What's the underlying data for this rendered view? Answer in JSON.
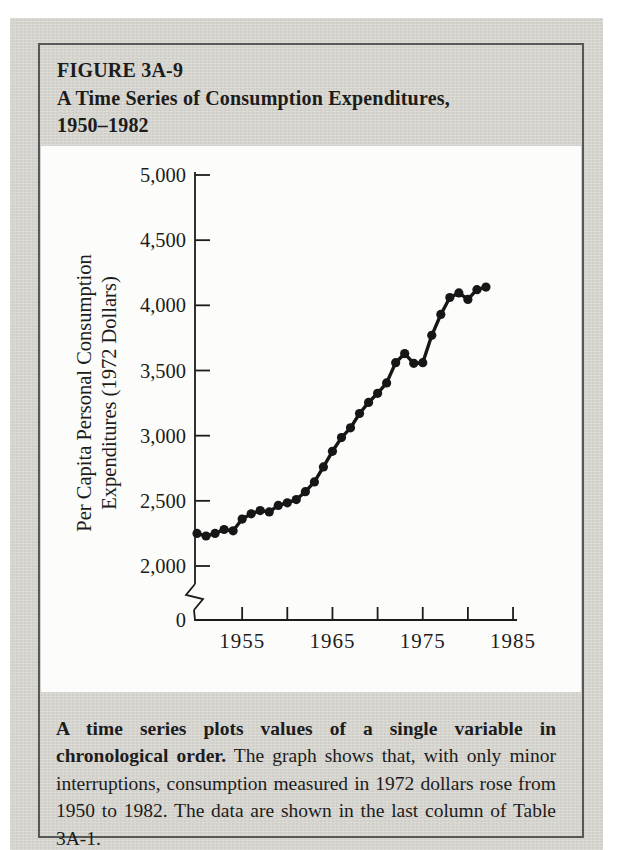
{
  "header": {
    "figure_label": "FIGURE 3A-9",
    "title_line1": "A Time Series of Consumption Expenditures,",
    "title_line2": "1950–1982"
  },
  "caption": {
    "lead": "A time series plots values of a single variable in chronological order.",
    "body": " The graph shows that, with only minor interruptions, consumption measured in 1972 dollars rose from 1950 to 1982. The data are shown in the last column of Table 3A-1."
  },
  "colors": {
    "page_bg": "#d8d6d0",
    "panel_bg": "#fcfcfa",
    "box_border": "#585858",
    "ink": "#1c1c1c"
  },
  "chart_data": {
    "type": "line",
    "title": "A Time Series of Consumption Expenditures, 1950–1982",
    "xlabel": "",
    "ylabel": "Per Capita Personal Consumption Expenditures (1972 Dollars)",
    "ylabel_lines": [
      "Per Capita Personal Consumption",
      "Expenditures (1972 Dollars)"
    ],
    "marker": "filled-circle",
    "grid": false,
    "legend": "none",
    "axis_break_above_zero": true,
    "xlim": [
      1950,
      1985
    ],
    "ylim": [
      2000,
      5000
    ],
    "origin_label": "0",
    "x_ticks": [
      1955,
      1960,
      1965,
      1970,
      1975,
      1980,
      1985
    ],
    "x_tick_labels": [
      "1955",
      "1965",
      "1975",
      "1985"
    ],
    "y_ticks": [
      2000,
      2500,
      3000,
      3500,
      4000,
      4500,
      5000
    ],
    "y_tick_labels": [
      "2,000",
      "2,500",
      "3,000",
      "3,500",
      "4,000",
      "4,500",
      "5,000"
    ],
    "x": [
      1950,
      1951,
      1952,
      1953,
      1954,
      1955,
      1956,
      1957,
      1958,
      1959,
      1960,
      1961,
      1962,
      1963,
      1964,
      1965,
      1966,
      1967,
      1968,
      1969,
      1970,
      1971,
      1972,
      1973,
      1974,
      1975,
      1976,
      1977,
      1978,
      1979,
      1980,
      1981,
      1982
    ],
    "y": [
      2250,
      2230,
      2250,
      2280,
      2270,
      2360,
      2400,
      2425,
      2415,
      2465,
      2485,
      2510,
      2570,
      2645,
      2760,
      2880,
      2985,
      3060,
      3170,
      3255,
      3325,
      3405,
      3560,
      3630,
      3555,
      3560,
      3770,
      3930,
      4060,
      4095,
      4045,
      4120,
      4140
    ]
  }
}
